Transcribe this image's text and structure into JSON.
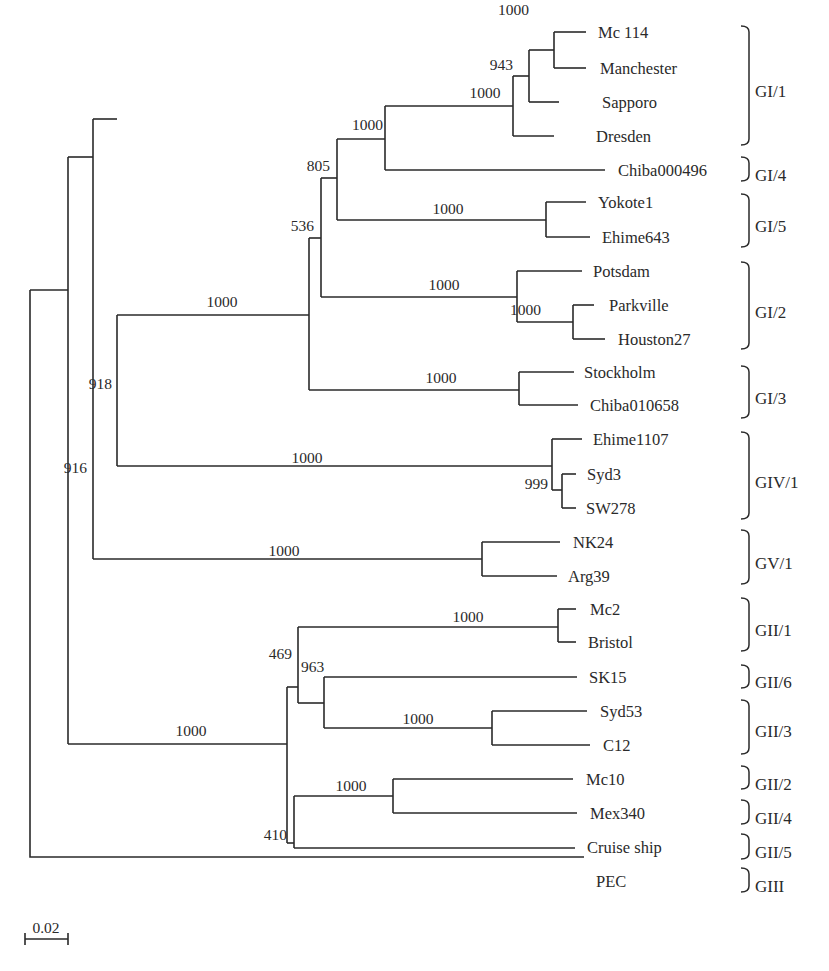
{
  "figure": {
    "type": "phylogenetic_tree",
    "scale_bar": {
      "label": "0.02",
      "x1": 25,
      "x2": 68,
      "y": 939
    }
  },
  "leaves": [
    {
      "id": "mc114",
      "label": "Mc 114",
      "x": 554,
      "tx": 598,
      "y": 32
    },
    {
      "id": "manchester",
      "label": "Manchester",
      "x": 554,
      "tx": 600,
      "y": 68
    },
    {
      "id": "sapporo",
      "label": "Sapporo",
      "x": 559,
      "tx": 602,
      "y": 102
    },
    {
      "id": "dresden",
      "label": "Dresden",
      "x": 554,
      "tx": 596,
      "y": 136
    },
    {
      "id": "chiba000496",
      "label": "Chiba000496",
      "x": 605,
      "tx": 618,
      "y": 170
    },
    {
      "id": "yokote1",
      "label": "Yokote1",
      "x": 586,
      "tx": 598,
      "y": 202
    },
    {
      "id": "ehime643",
      "label": "Ehime643",
      "x": 590,
      "tx": 602,
      "y": 237
    },
    {
      "id": "potsdam",
      "label": "Potsdam",
      "x": 582,
      "tx": 593,
      "y": 271
    },
    {
      "id": "parkville",
      "label": "Parkville",
      "x": 594,
      "tx": 609,
      "y": 305
    },
    {
      "id": "houston27",
      "label": "Houston27",
      "x": 605,
      "tx": 618,
      "y": 339
    },
    {
      "id": "stockholm",
      "label": "Stockholm",
      "x": 574,
      "tx": 584,
      "y": 372
    },
    {
      "id": "chiba010658",
      "label": "Chiba010658",
      "x": 578,
      "tx": 590,
      "y": 405
    },
    {
      "id": "ehime1107",
      "label": "Ehime1107",
      "x": 582,
      "tx": 593,
      "y": 439
    },
    {
      "id": "syd3",
      "label": "Syd3",
      "x": 576,
      "tx": 587,
      "y": 474
    },
    {
      "id": "sw278",
      "label": "SW278",
      "x": 576,
      "tx": 586,
      "y": 508
    },
    {
      "id": "nk24",
      "label": "NK24",
      "x": 560,
      "tx": 573,
      "y": 542
    },
    {
      "id": "arg39",
      "label": "Arg39",
      "x": 557,
      "tx": 568,
      "y": 576
    },
    {
      "id": "mc2",
      "label": "Mc2",
      "x": 576,
      "tx": 590,
      "y": 609
    },
    {
      "id": "bristol",
      "label": "Bristol",
      "x": 576,
      "tx": 588,
      "y": 642
    },
    {
      "id": "sk15",
      "label": "SK15",
      "x": 577,
      "tx": 589,
      "y": 677
    },
    {
      "id": "syd53",
      "label": "Syd53",
      "x": 587,
      "tx": 600,
      "y": 711
    },
    {
      "id": "c12",
      "label": "C12",
      "x": 590,
      "tx": 603,
      "y": 745
    },
    {
      "id": "mc10",
      "label": "Mc10",
      "x": 573,
      "tx": 586,
      "y": 779
    },
    {
      "id": "mex340",
      "label": "Mex340",
      "x": 577,
      "tx": 590,
      "y": 813
    },
    {
      "id": "cruise_ship",
      "label": "Cruise ship",
      "x": 575,
      "tx": 587,
      "y": 847
    },
    {
      "id": "pec",
      "label": "PEC",
      "x": 584,
      "tx": 596,
      "y": 881
    }
  ],
  "bootstrap": [
    {
      "value": "1000",
      "x": 529,
      "y": 15,
      "anchor": "end"
    },
    {
      "value": "943",
      "x": 513,
      "y": 70,
      "anchor": "end"
    },
    {
      "value": "1000",
      "x": 485,
      "y": 98,
      "anchor": "middle"
    },
    {
      "value": "1000",
      "x": 383,
      "y": 130,
      "anchor": "end"
    },
    {
      "value": "805",
      "x": 330,
      "y": 171,
      "anchor": "end"
    },
    {
      "value": "1000",
      "x": 448,
      "y": 214,
      "anchor": "middle"
    },
    {
      "value": "536",
      "x": 314,
      "y": 231,
      "anchor": "end"
    },
    {
      "value": "1000",
      "x": 444,
      "y": 290,
      "anchor": "middle"
    },
    {
      "value": "1000",
      "x": 541,
      "y": 315,
      "anchor": "end"
    },
    {
      "value": "1000",
      "x": 222,
      "y": 307,
      "anchor": "middle"
    },
    {
      "value": "1000",
      "x": 441,
      "y": 383,
      "anchor": "middle"
    },
    {
      "value": "918",
      "x": 112,
      "y": 389,
      "anchor": "end"
    },
    {
      "value": "916",
      "x": 87,
      "y": 473,
      "anchor": "end"
    },
    {
      "value": "1000",
      "x": 307,
      "y": 463,
      "anchor": "middle"
    },
    {
      "value": "999",
      "x": 548,
      "y": 489,
      "anchor": "end"
    },
    {
      "value": "1000",
      "x": 284,
      "y": 556,
      "anchor": "middle"
    },
    {
      "value": "1000",
      "x": 468,
      "y": 622,
      "anchor": "middle"
    },
    {
      "value": "469",
      "x": 292,
      "y": 659,
      "anchor": "end"
    },
    {
      "value": "963",
      "x": 301,
      "y": 672,
      "anchor": "start"
    },
    {
      "value": "1000",
      "x": 418,
      "y": 724,
      "anchor": "middle"
    },
    {
      "value": "1000",
      "x": 191,
      "y": 736,
      "anchor": "middle"
    },
    {
      "value": "1000",
      "x": 351,
      "y": 791,
      "anchor": "middle"
    },
    {
      "value": "410",
      "x": 287,
      "y": 840,
      "anchor": "end"
    }
  ],
  "groups": [
    {
      "label": "GI/1",
      "y1": 26,
      "y2": 145,
      "ly": 91
    },
    {
      "label": "GI/4",
      "y1": 157,
      "y2": 181,
      "ly": 175
    },
    {
      "label": "GI/5",
      "y1": 194,
      "y2": 247,
      "ly": 226
    },
    {
      "label": "GI/2",
      "y1": 262,
      "y2": 349,
      "ly": 312
    },
    {
      "label": "GI/3",
      "y1": 366,
      "y2": 418,
      "ly": 398
    },
    {
      "label": "GIV/1",
      "y1": 432,
      "y2": 519,
      "ly": 482
    },
    {
      "label": "GV/1",
      "y1": 530,
      "y2": 584,
      "ly": 563
    },
    {
      "label": "GII/1",
      "y1": 598,
      "y2": 651,
      "ly": 630
    },
    {
      "label": "GII/6",
      "y1": 665,
      "y2": 688,
      "ly": 682
    },
    {
      "label": "GII/3",
      "y1": 700,
      "y2": 754,
      "ly": 731
    },
    {
      "label": "GII/2",
      "y1": 766,
      "y2": 789,
      "ly": 784
    },
    {
      "label": "GII/4",
      "y1": 800,
      "y2": 824,
      "ly": 818
    },
    {
      "label": "GII/5",
      "y1": 834,
      "y2": 859,
      "ly": 852
    },
    {
      "label": "GIII",
      "y1": 868,
      "y2": 892,
      "ly": 886
    }
  ]
}
